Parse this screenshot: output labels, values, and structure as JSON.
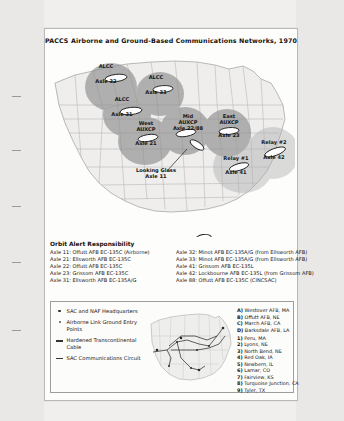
{
  "document": {
    "title": "PACCS Airborne and Ground-Based Communications Networks, 1970"
  },
  "map": {
    "orbits": [
      {
        "name": "alcc-axle-32",
        "line1": "ALCC",
        "line2": "Axle 32",
        "x": 58,
        "y": 22
      },
      {
        "name": "alcc-axle-33",
        "line1": "ALCC",
        "line2": "Axle 33",
        "x": 107,
        "y": 32
      },
      {
        "name": "alcc-axle-31",
        "line1": "ALCC",
        "line2": "Axle 31",
        "x": 74,
        "y": 55
      },
      {
        "name": "west-auxcp-axle-21",
        "line1": "West",
        "line1b": "AUXCP",
        "line2": "Axle 21",
        "x": 93,
        "y": 82
      },
      {
        "name": "mid-auxcp-axle-22-88",
        "line1": "Mid",
        "line1b": "AUXCP",
        "line2": "Axle 22/88",
        "x": 134,
        "y": 72
      },
      {
        "name": "east-auxcp-axle-23",
        "line1": "East",
        "line1b": "AUXCP",
        "line2": "Axle 23",
        "x": 175,
        "y": 74
      },
      {
        "name": "relay-1-axle-41",
        "line1": "Relay #1",
        "line2": "Axle 41",
        "x": 190,
        "y": 110
      },
      {
        "name": "relay-2-axle-42",
        "line1": "Relay #2",
        "line2": "Axle 42",
        "x": 222,
        "y": 96
      },
      {
        "name": "looking-glass-axle-11",
        "line1": "Looking Glass",
        "line2": "Axle 11",
        "x": 110,
        "y": 122
      }
    ],
    "legend": {
      "peacetime_orbit": "Peacetime Orbit"
    }
  },
  "orbit_alert": {
    "heading": "Orbit Alert Responsibility",
    "column_left": [
      "Axle 11: Offutt AFB EC-135C (Airborne)",
      "Axle 21: Ellsworth AFB EC-135C",
      "Axle 22: Offutt AFB EC-135C",
      "Axle 23: Grissom AFB EC-135C",
      "Axle 31: Ellsworth AFB EC-135A/G"
    ],
    "column_right": [
      "Axle 32: Minot AFB EC-135A/G (from Ellsworth AFB)",
      "Axle 33: Minot AFB EC-135A/G (from Ellsworth AFB)",
      "Axle 41: Grissom AFB EC-135L",
      "Axle 42: Lockbourne AFB EC-135L (from Grissom AFB)",
      "Axle 88: Offutt AFB EC-135C (CINCSAC)"
    ]
  },
  "panel": {
    "legend": [
      {
        "marker": "dot-large",
        "text": "SAC and NAF Headquarters"
      },
      {
        "marker": "dot-small",
        "text": "Airborne Link Ground Entry Points"
      },
      {
        "marker": "line",
        "text": "Hardened Transcontinental Cable"
      },
      {
        "marker": "line",
        "text": "SAC Communications Circuit"
      }
    ],
    "letter_keys": [
      {
        "key": "A)",
        "label": "Westover AFB, MA"
      },
      {
        "key": "B)",
        "label": "Offutt AFB, NE"
      },
      {
        "key": "C)",
        "label": "March AFB, CA"
      },
      {
        "key": "D)",
        "label": "Barksdale AFB, LA"
      }
    ],
    "number_keys": [
      {
        "key": "1)",
        "label": "Peru, MA"
      },
      {
        "key": "2)",
        "label": "Lyons, NE"
      },
      {
        "key": "3)",
        "label": "North Bend, NE"
      },
      {
        "key": "4)",
        "label": "Red Oak, IA"
      },
      {
        "key": "5)",
        "label": "Newbern, IL"
      },
      {
        "key": "6)",
        "label": "Lamar, CO"
      },
      {
        "key": "7)",
        "label": "Fairview, KS"
      },
      {
        "key": "8)",
        "label": "Turquoise Junction, CA"
      },
      {
        "key": "9)",
        "label": "Tyler, TX"
      }
    ]
  },
  "colors": {
    "orbit_fill_dark": "#8a8a8a",
    "orbit_fill_light": "#b9b9b9",
    "map_land": "#efeeed",
    "map_border": "#9d9d9d",
    "paper": "#fdfdfc"
  }
}
